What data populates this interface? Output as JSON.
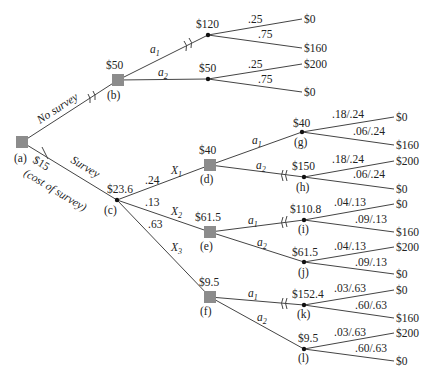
{
  "diagram": {
    "type": "decision-tree",
    "nodes": {
      "a": {
        "label": "(a)",
        "kind": "decision"
      },
      "b": {
        "label": "(b)",
        "kind": "decision",
        "value": "$50"
      },
      "b1": {
        "kind": "chance",
        "value": "$120"
      },
      "b2": {
        "kind": "chance",
        "value": "$50"
      },
      "c": {
        "label": "(c)",
        "kind": "chance",
        "value": "$23.6"
      },
      "d": {
        "label": "(d)",
        "kind": "decision",
        "value": "$40"
      },
      "e": {
        "label": "(e)",
        "kind": "decision",
        "value": "$61.5"
      },
      "f": {
        "label": "(f)",
        "kind": "decision",
        "value": "$9.5"
      },
      "g": {
        "label": "(g)",
        "kind": "chance",
        "value": "$40"
      },
      "h": {
        "label": "(h)",
        "kind": "chance",
        "value": "$150"
      },
      "i": {
        "label": "(i)",
        "kind": "chance",
        "value": "$110.8"
      },
      "j": {
        "label": "(j)",
        "kind": "chance",
        "value": "$61.5"
      },
      "k": {
        "label": "(k)",
        "kind": "chance",
        "value": "$152.4"
      },
      "l": {
        "label": "(l)",
        "kind": "chance",
        "value": "$9.5"
      }
    },
    "branches": {
      "no_survey": "No survey",
      "survey": "Survey",
      "survey_cost": "$15",
      "survey_cost_note": "(cost of survey)",
      "a1": "a",
      "a1_sub": "1",
      "a2": "a",
      "a2_sub": "2",
      "x1": "X",
      "x1_sub": "1",
      "x2": "X",
      "x2_sub": "2",
      "x3": "X",
      "x3_sub": "3",
      "p_x1": ".24",
      "p_x2": ".13",
      "p_x3": ".63"
    },
    "outcomes": {
      "b1": [
        {
          "prob": ".25",
          "payoff": "$0"
        },
        {
          "prob": ".75",
          "payoff": "$160"
        }
      ],
      "b2": [
        {
          "prob": ".25",
          "payoff": "$200"
        },
        {
          "prob": ".75",
          "payoff": "$0"
        }
      ],
      "g": [
        {
          "prob": ".18/.24",
          "payoff": "$0"
        },
        {
          "prob": ".06/.24",
          "payoff": "$160"
        }
      ],
      "h": [
        {
          "prob": ".18/.24",
          "payoff": "$200"
        },
        {
          "prob": ".06/.24",
          "payoff": "$0"
        }
      ],
      "i": [
        {
          "prob": ".04/.13",
          "payoff": "$0"
        },
        {
          "prob": ".09/.13",
          "payoff": "$160"
        }
      ],
      "j": [
        {
          "prob": ".04/.13",
          "payoff": "$200"
        },
        {
          "prob": ".09/.13",
          "payoff": "$0"
        }
      ],
      "k": [
        {
          "prob": ".03/.63",
          "payoff": "$0"
        },
        {
          "prob": ".60/.63",
          "payoff": "$160"
        }
      ],
      "l": [
        {
          "prob": ".03/.63",
          "payoff": "$200"
        },
        {
          "prob": ".60/.63",
          "payoff": "$0"
        }
      ]
    }
  }
}
